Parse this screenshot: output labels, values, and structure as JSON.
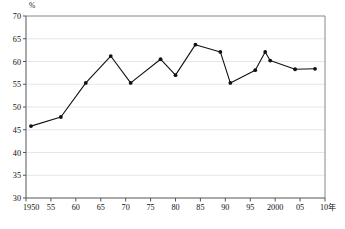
{
  "chart_data": {
    "type": "line",
    "title": "",
    "subtitle": "",
    "xlabel": "",
    "ylabel": "",
    "unit_label": "%",
    "x_axis_suffix_label": "10年",
    "grid": true,
    "grid_orientation": "horizontal",
    "legend": null,
    "legend_position": "none",
    "series_color": "#111111",
    "marker": "filled-circle",
    "xlim": [
      1950,
      2010
    ],
    "ylim": [
      30,
      70
    ],
    "y_ticks": [
      30,
      35,
      40,
      45,
      50,
      55,
      60,
      65,
      70
    ],
    "y_tick_labels": [
      "30",
      "35",
      "40",
      "45",
      "50",
      "55",
      "60",
      "65",
      "70"
    ],
    "x_ticks": [
      1950,
      1955,
      1960,
      1965,
      1970,
      1975,
      1980,
      1985,
      1990,
      1995,
      2000,
      2005,
      2010
    ],
    "x_tick_labels": [
      "1950",
      "55",
      "60",
      "65",
      "70",
      "75",
      "80",
      "85",
      "90",
      "95",
      "2000",
      "05",
      "10年"
    ],
    "series": [
      {
        "name": "",
        "points": [
          {
            "x": 1951,
            "y": 45.8
          },
          {
            "x": 1957,
            "y": 47.8
          },
          {
            "x": 1962,
            "y": 55.3
          },
          {
            "x": 1967,
            "y": 61.2
          },
          {
            "x": 1971,
            "y": 55.3
          },
          {
            "x": 1977,
            "y": 60.5
          },
          {
            "x": 1980,
            "y": 57.0
          },
          {
            "x": 1984,
            "y": 63.7
          },
          {
            "x": 1989,
            "y": 62.1
          },
          {
            "x": 1991,
            "y": 55.3
          },
          {
            "x": 1996,
            "y": 58.1
          },
          {
            "x": 1998,
            "y": 62.1
          },
          {
            "x": 1999,
            "y": 60.2
          },
          {
            "x": 2004,
            "y": 58.3
          },
          {
            "x": 2008,
            "y": 58.4
          }
        ]
      }
    ]
  }
}
